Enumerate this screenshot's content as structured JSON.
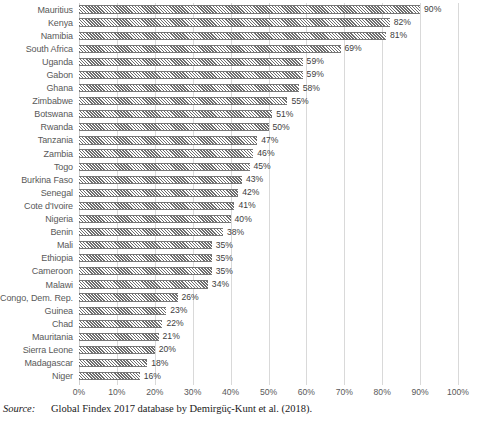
{
  "chart_data": {
    "type": "bar",
    "orientation": "horizontal",
    "title": "",
    "xlabel": "",
    "ylabel": "",
    "xlim": [
      0,
      100
    ],
    "grid": true,
    "legend": null,
    "value_suffix": "%",
    "categories": [
      "Mauritius",
      "Kenya",
      "Namibia",
      "South Africa",
      "Uganda",
      "Gabon",
      "Ghana",
      "Zimbabwe",
      "Botswana",
      "Rwanda",
      "Tanzania",
      "Zambia",
      "Togo",
      "Burkina Faso",
      "Senegal",
      "Cote d'Ivoire",
      "Nigeria",
      "Benin",
      "Mali",
      "Ethiopia",
      "Cameroon",
      "Malawi",
      "Congo, Dem. Rep.",
      "Guinea",
      "Chad",
      "Mauritania",
      "Sierra Leone",
      "Madagascar",
      "Niger"
    ],
    "values": [
      90,
      82,
      81,
      69,
      59,
      59,
      58,
      55,
      51,
      50,
      47,
      46,
      45,
      43,
      42,
      41,
      40,
      38,
      35,
      35,
      35,
      34,
      26,
      23,
      22,
      21,
      20,
      18,
      16
    ],
    "data_labels": [
      "90%",
      "82%",
      "81%",
      "69%",
      "59%",
      "59%",
      "58%",
      "55%",
      "51%",
      "50%",
      "47%",
      "46%",
      "45%",
      "43%",
      "42%",
      "41%",
      "40%",
      "38%",
      "35%",
      "35%",
      "35%",
      "34%",
      "26%",
      "23%",
      "22%",
      "21%",
      "20%",
      "18%",
      "16%"
    ],
    "xticks": [
      0,
      10,
      20,
      30,
      40,
      50,
      60,
      70,
      80,
      90,
      100
    ],
    "xtick_labels": [
      "0%",
      "10%",
      "20%",
      "30%",
      "40%",
      "50%",
      "60%",
      "70%",
      "80%",
      "90%",
      "100%"
    ],
    "colors": {
      "bar_hatch": "#6e6e6e",
      "bar_fill": "#ffffff",
      "gridline": "#d9d9d9",
      "label_text": "#595959",
      "value_text": "#404040"
    }
  },
  "source": {
    "label": "Source:",
    "text": "Global Findex 2017 database by Demirgüç-Kunt et al. (2018)."
  }
}
